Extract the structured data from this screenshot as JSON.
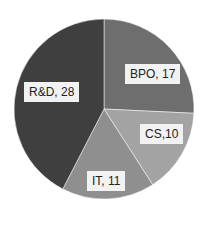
{
  "chart_data": {
    "type": "pie",
    "title": "",
    "categories": [
      "BPO",
      "CS",
      "IT",
      "R&D"
    ],
    "values": [
      17,
      10,
      11,
      28
    ],
    "colors": [
      "#6e6e6e",
      "#a3a3a3",
      "#8f8f8f",
      "#3f3f3f"
    ],
    "labels": [
      "BPO, 17",
      "CS,10",
      "IT, 11",
      "R&D, 28"
    ],
    "start_angle": "12 o'clock",
    "direction": "clockwise",
    "legend": "none"
  }
}
